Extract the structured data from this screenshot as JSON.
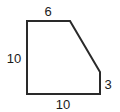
{
  "diagram": {
    "shape": "pentagon",
    "stroke_color": "#2a2a2a",
    "fill_color": "#ffffff",
    "vertices": [
      [
        27,
        21
      ],
      [
        70,
        21
      ],
      [
        100,
        72
      ],
      [
        100,
        94
      ],
      [
        27,
        94
      ]
    ],
    "labels": {
      "top": "6",
      "left": "10",
      "right": "3",
      "bottom": "10"
    }
  }
}
